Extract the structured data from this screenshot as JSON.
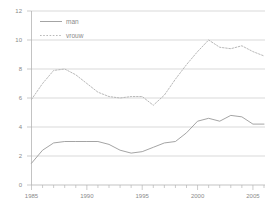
{
  "chart_data": {
    "type": "line",
    "title": "",
    "xlabel": "",
    "ylabel": "",
    "xlim": [
      1985,
      2006
    ],
    "ylim": [
      0,
      12
    ],
    "xticks": [
      1985,
      1990,
      1995,
      2000,
      2005
    ],
    "xtick_labels": [
      "1985",
      "1990",
      "1995",
      "2000",
      "2005"
    ],
    "yticks": [
      0,
      2,
      4,
      6,
      8,
      10,
      12
    ],
    "ytick_labels": [
      "0",
      "2",
      "4",
      "6",
      "8",
      "10",
      "12"
    ],
    "grid": true,
    "grid_axis": "y",
    "legend_position": "top-left",
    "x": [
      1985,
      1986,
      1987,
      1988,
      1989,
      1990,
      1991,
      1992,
      1993,
      1994,
      1995,
      1996,
      1997,
      1998,
      1999,
      2000,
      2001,
      2002,
      2003,
      2004,
      2005,
      2006
    ],
    "series": [
      {
        "name": "man",
        "style": "solid",
        "color": "#9a9a9a",
        "values": [
          1.5,
          2.4,
          2.9,
          3.0,
          3.0,
          3.0,
          3.0,
          2.8,
          2.4,
          2.2,
          2.3,
          2.6,
          2.9,
          3.0,
          3.6,
          4.4,
          4.6,
          4.4,
          4.8,
          4.7,
          4.2,
          4.2
        ]
      },
      {
        "name": "vrouw",
        "style": "dotted",
        "color": "#b0b0b0",
        "values": [
          5.9,
          7.0,
          7.9,
          8.0,
          7.6,
          7.0,
          6.4,
          6.1,
          6.0,
          6.1,
          6.1,
          5.5,
          6.2,
          7.3,
          8.3,
          9.2,
          10.0,
          9.5,
          9.4,
          9.6,
          9.2,
          8.9
        ]
      }
    ]
  },
  "legend": {
    "items": [
      {
        "label": "man",
        "style": "solid"
      },
      {
        "label": "vrouw",
        "style": "dotted"
      }
    ]
  },
  "colors": {
    "background": "#ffffff",
    "grid": "#c8c8c8",
    "axis": "#b4b4b4",
    "text": "#8a8a8a",
    "series_man": "#9a9a9a",
    "series_vrouw": "#b0b0b0"
  }
}
